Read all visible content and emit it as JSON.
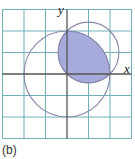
{
  "figure": {
    "caption": "(b)",
    "x_label": "x",
    "y_label": "y"
  },
  "grid": {
    "columns": 6,
    "rows": 6,
    "unit_px": 21.5,
    "origin_px": [
      67,
      74
    ],
    "line_color": "#6fb0bb",
    "axis_color": "#555555"
  },
  "shapes": {
    "large_circle": {
      "center": [
        0,
        0
      ],
      "radius": 2,
      "stroke": "#8a86aa"
    },
    "small_circle": {
      "center": [
        1,
        1
      ],
      "radius": 1.414,
      "stroke": "#8a86aa"
    },
    "shaded_region": {
      "description": "intersection of circles in first quadrant",
      "fill": "#a7abdc"
    }
  }
}
